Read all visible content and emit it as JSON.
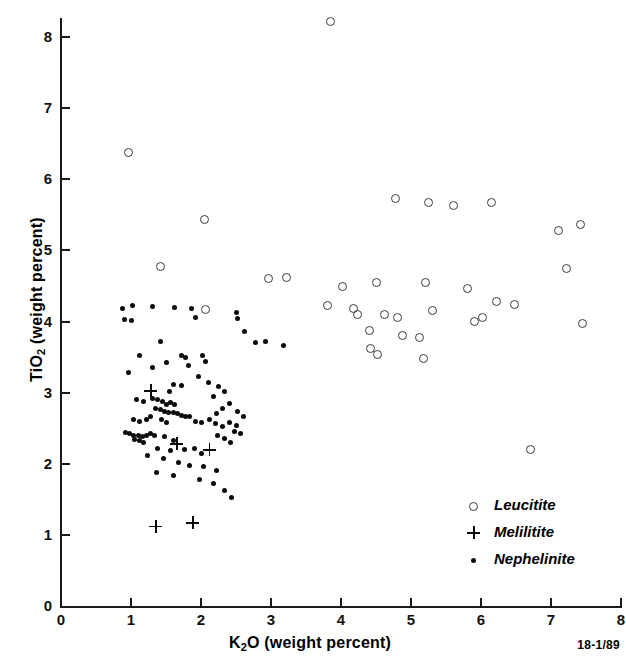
{
  "chart_data": {
    "type": "scatter",
    "title": "",
    "xlabel": "K2O (weight percent)",
    "ylabel": "TiO2 (weight percent)",
    "xlabel_parts": {
      "pre": "K",
      "sub": "2",
      "post": "O (weight percent)"
    },
    "ylabel_parts": {
      "pre": "TiO",
      "sub": "2",
      "post": " (weight percent)"
    },
    "xlim": [
      0,
      8
    ],
    "ylim": [
      0,
      8.6
    ],
    "xticks": [
      0,
      1,
      2,
      3,
      4,
      5,
      6,
      7,
      8
    ],
    "yticks": [
      0,
      1,
      2,
      3,
      4,
      5,
      6,
      7,
      8
    ],
    "xtick_labels": [
      "0",
      "1",
      "2",
      "3",
      "4",
      "5",
      "6",
      "7",
      "8"
    ],
    "ytick_labels": [
      "0",
      "1",
      "2",
      "3",
      "4",
      "5",
      "6",
      "7",
      "8"
    ],
    "grid": false,
    "legend_position": "bottom-right",
    "figure_id": "18-1/89",
    "marker_colors": {
      "leucitite": "#3a3a44",
      "melilitite": "#0b0b0b",
      "nephelinite": "#0b0b0b"
    },
    "series": [
      {
        "name": "Leucitite",
        "marker": "open-circle",
        "points": [
          [
            3.85,
            8.22
          ],
          [
            0.97,
            6.38
          ],
          [
            2.05,
            5.43
          ],
          [
            4.78,
            5.73
          ],
          [
            5.25,
            5.68
          ],
          [
            5.6,
            5.63
          ],
          [
            6.15,
            5.67
          ],
          [
            7.1,
            5.28
          ],
          [
            7.42,
            5.37
          ],
          [
            1.42,
            4.77
          ],
          [
            7.22,
            4.74
          ],
          [
            2.97,
            4.6
          ],
          [
            3.22,
            4.62
          ],
          [
            4.02,
            4.49
          ],
          [
            4.5,
            4.55
          ],
          [
            5.2,
            4.55
          ],
          [
            5.8,
            4.46
          ],
          [
            6.22,
            4.28
          ],
          [
            6.48,
            4.24
          ],
          [
            3.8,
            4.23
          ],
          [
            4.18,
            4.18
          ],
          [
            4.24,
            4.1
          ],
          [
            4.62,
            4.1
          ],
          [
            4.8,
            4.05
          ],
          [
            5.3,
            4.16
          ],
          [
            5.9,
            4.0
          ],
          [
            6.02,
            4.06
          ],
          [
            7.45,
            3.97
          ],
          [
            2.07,
            4.17
          ],
          [
            4.4,
            3.88
          ],
          [
            4.88,
            3.8
          ],
          [
            5.12,
            3.78
          ],
          [
            4.42,
            3.62
          ],
          [
            4.52,
            3.54
          ],
          [
            5.18,
            3.48
          ],
          [
            6.7,
            2.2
          ]
        ]
      },
      {
        "name": "Melilitite",
        "marker": "plus",
        "points": [
          [
            1.28,
            3.03
          ],
          [
            1.65,
            2.28
          ],
          [
            2.12,
            2.2
          ],
          [
            1.35,
            1.12
          ],
          [
            1.88,
            1.17
          ]
        ]
      },
      {
        "name": "Nephelinite",
        "marker": "filled-dot",
        "points": [
          [
            0.88,
            4.18
          ],
          [
            1.02,
            4.22
          ],
          [
            1.3,
            4.21
          ],
          [
            0.9,
            4.03
          ],
          [
            1.0,
            4.02
          ],
          [
            1.62,
            4.2
          ],
          [
            1.92,
            4.05
          ],
          [
            2.5,
            4.13
          ],
          [
            2.52,
            4.04
          ],
          [
            2.62,
            3.86
          ],
          [
            2.78,
            3.7
          ],
          [
            2.92,
            3.72
          ],
          [
            3.18,
            3.66
          ],
          [
            1.42,
            3.72
          ],
          [
            1.12,
            3.52
          ],
          [
            1.5,
            3.43
          ],
          [
            1.72,
            3.52
          ],
          [
            1.78,
            3.5
          ],
          [
            1.82,
            3.38
          ],
          [
            1.3,
            3.35
          ],
          [
            1.96,
            3.22
          ],
          [
            2.1,
            3.14
          ],
          [
            1.6,
            3.12
          ],
          [
            1.72,
            3.1
          ],
          [
            1.55,
            3.02
          ],
          [
            2.25,
            3.08
          ],
          [
            2.34,
            3.02
          ],
          [
            2.18,
            2.95
          ],
          [
            2.4,
            2.85
          ],
          [
            2.3,
            2.78
          ],
          [
            1.08,
            2.9
          ],
          [
            1.18,
            2.88
          ],
          [
            1.3,
            2.92
          ],
          [
            1.38,
            2.9
          ],
          [
            1.45,
            2.88
          ],
          [
            1.5,
            2.84
          ],
          [
            1.56,
            2.86
          ],
          [
            1.62,
            2.84
          ],
          [
            1.35,
            2.78
          ],
          [
            1.42,
            2.76
          ],
          [
            1.48,
            2.74
          ],
          [
            1.54,
            2.72
          ],
          [
            1.6,
            2.72
          ],
          [
            1.66,
            2.7
          ],
          [
            1.72,
            2.68
          ],
          [
            1.78,
            2.66
          ],
          [
            1.84,
            2.66
          ],
          [
            1.28,
            2.66
          ],
          [
            1.22,
            2.62
          ],
          [
            1.12,
            2.6
          ],
          [
            1.04,
            2.62
          ],
          [
            1.44,
            2.62
          ],
          [
            1.5,
            2.58
          ],
          [
            1.92,
            2.6
          ],
          [
            2.0,
            2.58
          ],
          [
            2.12,
            2.62
          ],
          [
            2.2,
            2.56
          ],
          [
            2.3,
            2.52
          ],
          [
            2.4,
            2.58
          ],
          [
            2.5,
            2.54
          ],
          [
            0.92,
            2.44
          ],
          [
            0.98,
            2.42
          ],
          [
            1.04,
            2.4
          ],
          [
            1.1,
            2.4
          ],
          [
            1.16,
            2.38
          ],
          [
            1.22,
            2.4
          ],
          [
            1.28,
            2.42
          ],
          [
            1.34,
            2.4
          ],
          [
            1.05,
            2.34
          ],
          [
            1.12,
            2.32
          ],
          [
            1.18,
            2.3
          ],
          [
            1.48,
            2.38
          ],
          [
            1.6,
            2.32
          ],
          [
            2.24,
            2.4
          ],
          [
            2.34,
            2.36
          ],
          [
            2.42,
            2.3
          ],
          [
            1.38,
            2.22
          ],
          [
            1.56,
            2.18
          ],
          [
            1.76,
            2.2
          ],
          [
            1.9,
            2.22
          ],
          [
            2.0,
            2.14
          ],
          [
            1.24,
            2.12
          ],
          [
            1.46,
            2.08
          ],
          [
            1.68,
            2.02
          ],
          [
            1.84,
            1.98
          ],
          [
            2.04,
            1.96
          ],
          [
            2.22,
            1.9
          ],
          [
            1.36,
            1.88
          ],
          [
            1.6,
            1.84
          ],
          [
            1.98,
            1.78
          ],
          [
            2.18,
            1.72
          ],
          [
            2.34,
            1.62
          ],
          [
            2.44,
            1.52
          ],
          [
            2.22,
            2.7
          ],
          [
            2.52,
            2.74
          ],
          [
            2.6,
            2.66
          ],
          [
            2.48,
            2.46
          ],
          [
            2.56,
            2.42
          ],
          [
            0.96,
            3.28
          ],
          [
            2.02,
            3.52
          ],
          [
            2.06,
            3.44
          ],
          [
            1.86,
            4.18
          ]
        ]
      }
    ]
  },
  "legend": {
    "items": [
      {
        "label": "Leucitite",
        "marker": "open-circle"
      },
      {
        "label": "Melilitite",
        "marker": "plus"
      },
      {
        "label": "Nephelinite",
        "marker": "filled-dot"
      }
    ]
  }
}
